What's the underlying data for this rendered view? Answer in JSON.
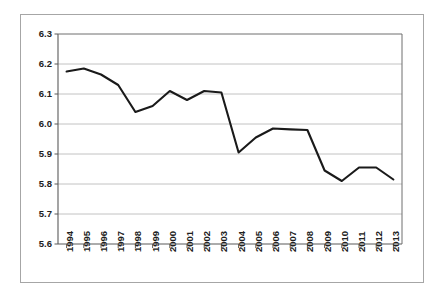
{
  "chart_data": {
    "type": "line",
    "title": "",
    "subtitle": "",
    "xlabel": "",
    "ylabel": "",
    "categories": [
      "1994",
      "1995",
      "1996",
      "1997",
      "1998",
      "1999",
      "2000",
      "2001",
      "2002",
      "2003",
      "2004",
      "2005",
      "2006",
      "2007",
      "2008",
      "2009",
      "2010",
      "2011",
      "2012",
      "2013"
    ],
    "series": [
      {
        "name": "",
        "values": [
          6.175,
          6.185,
          6.165,
          6.13,
          6.04,
          6.06,
          6.11,
          6.08,
          6.11,
          6.105,
          5.905,
          5.955,
          5.985,
          5.982,
          5.98,
          5.845,
          5.81,
          5.855,
          5.855,
          5.815
        ]
      }
    ],
    "ylim": [
      5.6,
      6.3
    ],
    "ytick_labels": [
      "6.3",
      "6.2",
      "6.1",
      "6.0",
      "5.9",
      "5.8",
      "5.7",
      "5.6"
    ],
    "ytick_values": [
      6.3,
      6.2,
      6.1,
      6.0,
      5.9,
      5.8,
      5.7,
      5.6
    ],
    "grid": true,
    "grid_axis": "y",
    "legend": false,
    "legend_position": "none",
    "line_color": "#1a1a1a",
    "grid_color": "#b3b3b3",
    "axis_color": "#5a5a5a",
    "background_color": "#ffffff",
    "xtick_label_rotation": -90,
    "annotations": []
  }
}
